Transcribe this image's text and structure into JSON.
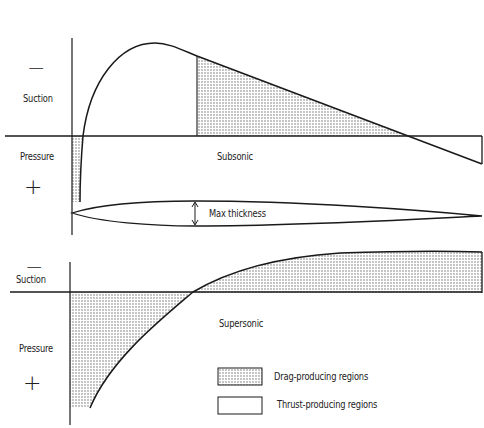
{
  "subsonic_panel": {
    "sign_top": "−",
    "suction_label": "Suction",
    "pressure_label": "Pressure",
    "sign_bottom": "+",
    "regime_label": "Subsonic"
  },
  "airfoil": {
    "max_thickness_label": "Max thickness"
  },
  "supersonic_panel": {
    "sign_top": "−",
    "suction_label": "Suction",
    "pressure_label": "Pressure",
    "sign_bottom": "+",
    "regime_label": "Supersonic"
  },
  "legend": {
    "items": [
      {
        "label": "Drag-producing regions",
        "swatch": "dotted"
      },
      {
        "label": "Thrust-producing regions",
        "swatch": "empty"
      }
    ]
  },
  "colors": {
    "line": "#1a1a1a",
    "stipple": "#6b6b6b",
    "background": "#ffffff"
  }
}
